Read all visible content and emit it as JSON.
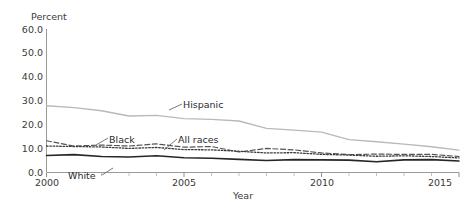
{
  "chart_data": {
    "type": "line",
    "title": "",
    "xlabel": "Year",
    "ylabel": "Percent",
    "xlim": [
      2000,
      2015
    ],
    "ylim": [
      0.0,
      60.0
    ],
    "grid": false,
    "legend_position": "inline-annotations",
    "y_ticks": [
      "0.0",
      "10.0",
      "20.0",
      "30.0",
      "40.0",
      "50.0",
      "60.0"
    ],
    "y_tick_values": [
      0.0,
      10.0,
      20.0,
      30.0,
      40.0,
      50.0,
      60.0
    ],
    "x_ticks": [
      "2000",
      "2005",
      "2010",
      "2015"
    ],
    "x_tick_values": [
      2000,
      2005,
      2010,
      2015
    ],
    "x_minor_ticks": [
      2001,
      2002,
      2003,
      2004,
      2006,
      2007,
      2008,
      2009,
      2011,
      2012,
      2013,
      2014
    ],
    "x": [
      2000,
      2001,
      2002,
      2003,
      2004,
      2005,
      2006,
      2007,
      2008,
      2009,
      2010,
      2011,
      2012,
      2013,
      2014,
      2015
    ],
    "series": [
      {
        "name": "Hispanic",
        "style": "solid-light",
        "color": "#b9b9b9",
        "width": 1.3,
        "values": [
          27.8,
          27.0,
          25.7,
          23.5,
          23.8,
          22.4,
          22.1,
          21.4,
          18.3,
          17.6,
          16.7,
          13.6,
          12.7,
          11.7,
          10.6,
          9.2
        ]
      },
      {
        "name": "Black",
        "style": "dashed",
        "color": "#545454",
        "width": 1.2,
        "values": [
          13.1,
          10.9,
          11.3,
          10.9,
          11.8,
          10.4,
          10.7,
          8.4,
          9.9,
          9.3,
          8.0,
          7.3,
          7.5,
          7.4,
          7.4,
          6.5
        ]
      },
      {
        "name": "All races",
        "style": "dotted",
        "color": "#3c3c3c",
        "width": 1.3,
        "values": [
          10.9,
          10.7,
          10.5,
          9.9,
          10.3,
          9.4,
          9.3,
          8.7,
          8.0,
          8.1,
          7.4,
          7.1,
          6.6,
          6.8,
          6.5,
          5.9
        ]
      },
      {
        "name": "White",
        "style": "solid-dark",
        "color": "#262626",
        "width": 1.6,
        "values": [
          6.9,
          7.3,
          6.5,
          6.3,
          6.8,
          6.0,
          5.8,
          5.3,
          4.8,
          5.2,
          5.1,
          5.0,
          4.3,
          5.1,
          5.2,
          4.6
        ]
      }
    ],
    "annotations": [
      {
        "text": "Hispanic",
        "x": 178,
        "y": 108
      },
      {
        "text": "Black",
        "x": 103,
        "y": 143
      },
      {
        "text": "All races",
        "x": 172,
        "y": 143
      },
      {
        "text": "White",
        "x": 73,
        "y": 178
      }
    ]
  },
  "axis": {
    "y_title": "Percent",
    "x_title": "Year",
    "y_labels": [
      "60.0",
      "50.0",
      "40.0",
      "30.0",
      "20.0",
      "10.0",
      "0.0"
    ],
    "x_labels": [
      "2000",
      "2005",
      "2010",
      "2015"
    ]
  },
  "labels": {
    "hispanic": "Hispanic",
    "black": "Black",
    "all_races": "All races",
    "white": "White"
  }
}
